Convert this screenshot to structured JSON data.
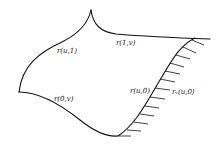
{
  "diagram": {
    "type": "parametric surface patch boundary",
    "labels": {
      "top_left_curve": "r(u,1)",
      "top_right_curve": "r(1,v)",
      "bottom_left_curve": "r(0,v)",
      "right_curve": "r(u,0)",
      "tangent_vectors": "rᵥ(u,0)"
    },
    "colors": {
      "stroke": "#111111",
      "background": "#ffffff"
    }
  }
}
